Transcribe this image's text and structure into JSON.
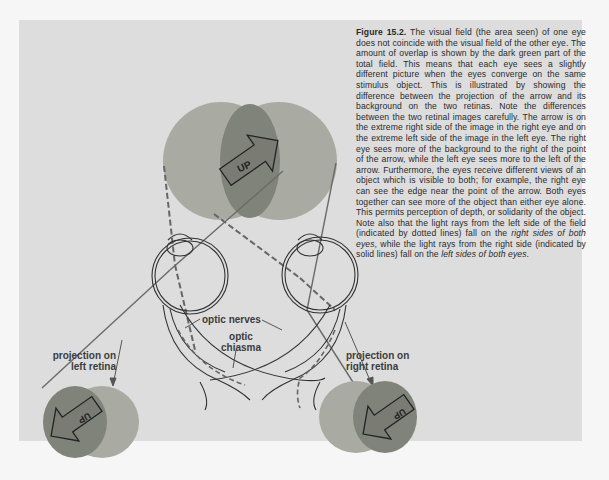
{
  "figure": {
    "label": "Figure 15.2.",
    "caption_part1": " The visual field (the area seen) of one eye does not coincide with the visual field of the other eye. The amount of overlap is shown by the dark green part of the total field. This means that each eye sees a slightly different picture when the eyes converge on the same stimulus object. This is illustrated by showing the difference between the projection of the arrow and its background on the two retinas. Note the differences between the two retinal images carefully. The arrow is on the extreme right side of the image in the right eye and on the extreme left side of the image in the left eye. The right eye sees more of the background to the right of the point of the arrow, while the left eye sees more to the left of the arrow. Furthermore, the eyes receive different views of an object which is visible to both; for example, the right eye can see the edge near the point of the arrow. Both eyes together can see more of the object than either eye alone. This permits perception of depth, or solidarity of the object. Note also that the light rays from the left side of the field (indicated by dotted lines) fall on the ",
    "caption_italic1": "right sides of both eyes",
    "caption_part2": ", while the light rays from the right side (indicated by solid lines) fall on the ",
    "caption_italic2": "left sides of both eyes",
    "caption_part3": "."
  },
  "diagram": {
    "arrow_label_top": "UP",
    "arrow_label_left_retina": "UP",
    "arrow_label_right_retina": "UP",
    "labels": {
      "optic_nerves": "optic nerves",
      "optic_chiasma_line1": "optic",
      "optic_chiasma_line2": "chiasma",
      "left_projection_line1": "projection on",
      "left_projection_line2": "left retina",
      "right_projection_line1": "projection on",
      "right_projection_line2": "right retina"
    },
    "colors": {
      "panel_bg": "#dddddd",
      "field_light": "#a8aaa0",
      "field_overlap": "#7f827a",
      "line": "#555555"
    }
  }
}
